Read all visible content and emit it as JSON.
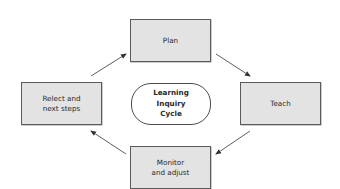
{
  "diagram": {
    "center": {
      "label": "Learning\nInquiry\nCycle"
    },
    "nodes": [
      {
        "id": "plan",
        "label": "Plan"
      },
      {
        "id": "teach",
        "label": "Teach"
      },
      {
        "id": "monitor",
        "label": "Monitor\nand adjust"
      },
      {
        "id": "reflect",
        "label": "Relect and\nnext steps"
      }
    ],
    "edges": [
      {
        "from": "reflect",
        "to": "plan"
      },
      {
        "from": "plan",
        "to": "teach"
      },
      {
        "from": "teach",
        "to": "monitor"
      },
      {
        "from": "monitor",
        "to": "reflect"
      }
    ],
    "colors": {
      "box_fill": "#e3e3e3",
      "box_border": "#5a5a5a",
      "oval_fill": "#ffffff",
      "arrow": "#333333"
    }
  }
}
